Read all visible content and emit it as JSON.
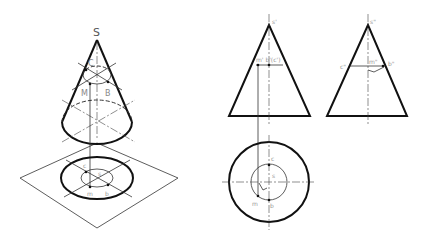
{
  "figure": {
    "isometric_view": {
      "apex_label": "S",
      "upper_points": [
        "C",
        "M",
        "B"
      ],
      "ground_points": [
        "c",
        "s",
        "m",
        "b"
      ]
    },
    "front_view": {
      "apex_label": "s'",
      "section_label": "m' b'(c')"
    },
    "side_view": {
      "apex_label": "s\"",
      "left_label": "c\"",
      "mid_label": "m\"",
      "right_label": "b\""
    },
    "top_view": {
      "labels": {
        "c": "c",
        "s": "s",
        "m": "m",
        "b": "b"
      }
    }
  },
  "labels": {
    "S": "S",
    "C_upper": "C",
    "M_upper": "M",
    "B_upper": "B",
    "c_ground": "c",
    "s_ground": "s",
    "m_ground": "m",
    "b_ground": "b",
    "s_prime": "s'",
    "front_section": "m' b'(c')",
    "s_dprime": "s\"",
    "c_dprime": "c\"",
    "m_dprime": "m\"",
    "b_dprime": "b\"",
    "c_top": "c",
    "s_top": "s",
    "m_top": "m",
    "b_top": "b"
  },
  "colors": {
    "line": "#111111",
    "label": "#888888",
    "background": "#ffffff"
  }
}
